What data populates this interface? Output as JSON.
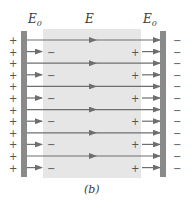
{
  "diagram": {
    "labels": {
      "left_field": "E",
      "left_field_sub": "0",
      "center_field": "E",
      "right_field": "E",
      "right_field_sub": "0",
      "caption": "(b)"
    },
    "rows": 12,
    "plates": {
      "left_charge": "+",
      "right_charge": "−"
    },
    "dielectric": {
      "near_left_charge": "−",
      "near_right_charge": "+"
    },
    "colors": {
      "plate": "#8a8a8a",
      "dielectric": "#e6e6e6",
      "arrow": "#6e6e6e",
      "text": "#3a3a3a"
    }
  }
}
